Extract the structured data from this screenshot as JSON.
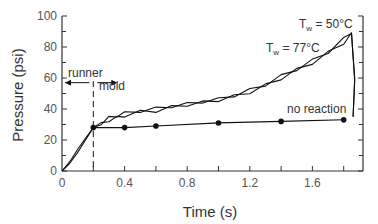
{
  "chart_data": {
    "type": "line",
    "title": "",
    "xlabel": "Time (s)",
    "ylabel": "Pressure (psi)",
    "xlim": [
      0,
      1.9
    ],
    "ylim": [
      0,
      100
    ],
    "grid": false,
    "x_ticks_labeled": [
      0,
      0.4,
      0.8,
      1.2,
      1.6
    ],
    "x_tick_labels": [
      "0",
      "0.4",
      "0.8",
      "1.2",
      "1.6"
    ],
    "x_ticks_minor": [
      0.2,
      0.6,
      1.0,
      1.4,
      1.8
    ],
    "y_ticks": [
      0,
      20,
      40,
      60,
      80,
      100
    ],
    "y_tick_labels": [
      "0",
      "20",
      "40",
      "60",
      "80",
      "100"
    ],
    "y_ticks_minor": [
      10,
      30,
      50,
      70,
      90
    ],
    "series": [
      {
        "name": "Tw = 50°C",
        "style": "line, no markers",
        "x": [
          0.0,
          0.05,
          0.1,
          0.15,
          0.2,
          0.25,
          0.3,
          0.35,
          0.4,
          0.5,
          0.6,
          0.7,
          0.8,
          0.9,
          1.0,
          1.1,
          1.2,
          1.3,
          1.4,
          1.5,
          1.6,
          1.7,
          1.8,
          1.85
        ],
        "y": [
          0,
          6,
          14,
          21,
          28,
          31,
          34,
          36,
          37,
          39,
          40,
          42,
          43,
          45,
          46,
          49,
          52,
          56,
          61,
          66,
          71,
          77,
          85,
          90
        ]
      },
      {
        "name": "Tw = 77°C",
        "style": "line, no markers",
        "x": [
          0.0,
          0.05,
          0.1,
          0.15,
          0.2,
          0.25,
          0.3,
          0.35,
          0.4,
          0.5,
          0.6,
          0.7,
          0.8,
          0.9,
          1.0,
          1.1,
          1.2,
          1.3,
          1.4,
          1.5,
          1.6,
          1.7,
          1.8,
          1.85
        ],
        "y": [
          0,
          5,
          12,
          20,
          28,
          30,
          33,
          34,
          36,
          38,
          39,
          41,
          43,
          44,
          46,
          48,
          51,
          55,
          60,
          65,
          70,
          76,
          83,
          88
        ]
      },
      {
        "name": "no reaction",
        "style": "line with filled circle markers",
        "x": [
          0.2,
          0.4,
          0.6,
          1.0,
          1.4,
          1.8
        ],
        "y": [
          28,
          28,
          29,
          31,
          32,
          33
        ]
      }
    ],
    "annotations": [
      {
        "text": "runner",
        "x": 0.1,
        "y": 62,
        "note": "left arrow spanning 0 to 0.2 s"
      },
      {
        "text": "mold",
        "x": 0.3,
        "y": 54,
        "note": "right arrow starting at 0.2 s"
      },
      {
        "text": "no reaction",
        "x": 1.55,
        "y": 37
      },
      {
        "text": "Tw = 50°C",
        "x": 1.6,
        "y": 94
      },
      {
        "text": "Tw = 77°C",
        "x": 1.37,
        "y": 82
      },
      {
        "text": "dashed vertical line at t = 0.2 s (runner/mold boundary)"
      }
    ]
  },
  "labels": {
    "xlabel": "Time (s)",
    "ylabel": "Pressure (psi)",
    "runner": "runner",
    "mold": "mold",
    "no_reaction": "no reaction",
    "tw50_main": "T",
    "tw50_sub": "w",
    "tw50_rest": " = 50°C",
    "tw77_main": "T",
    "tw77_sub": "w",
    "tw77_rest": " = 77°C"
  },
  "colors": {
    "line": "#111111",
    "axis": "#333333",
    "text": "#555555"
  }
}
